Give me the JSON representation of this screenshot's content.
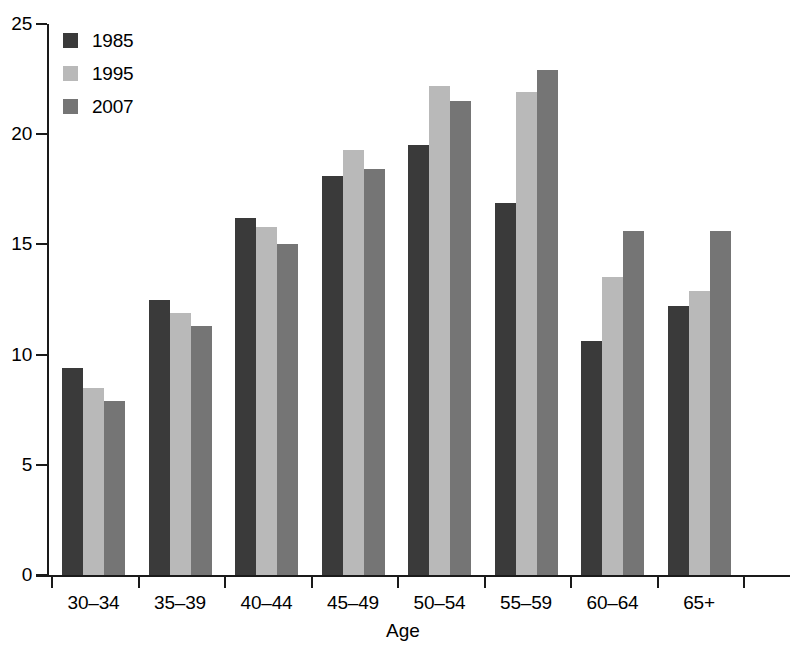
{
  "chart_data": {
    "type": "bar",
    "title": "",
    "subtitle": "",
    "xlabel": "Age",
    "ylabel": "",
    "categories": [
      "30–34",
      "35–39",
      "40–44",
      "45–49",
      "50–54",
      "55–59",
      "60–64",
      "65+"
    ],
    "series": [
      {
        "name": "1985",
        "color": "#3a3a3a",
        "values": [
          9.4,
          12.5,
          16.2,
          18.1,
          19.5,
          16.9,
          10.6,
          12.2
        ]
      },
      {
        "name": "1995",
        "color": "#b9b9b9",
        "values": [
          8.5,
          11.9,
          15.8,
          19.3,
          22.2,
          21.9,
          13.5,
          12.9
        ]
      },
      {
        "name": "2007",
        "color": "#757575",
        "values": [
          7.9,
          11.3,
          15.0,
          18.4,
          21.5,
          22.9,
          15.6,
          15.6
        ]
      }
    ],
    "ylim": [
      0,
      25
    ],
    "yticks": [
      0,
      5,
      10,
      15,
      20,
      25
    ],
    "ytick_labels": [
      "0",
      "5",
      "10",
      "15",
      "20",
      "25"
    ],
    "grid": false,
    "legend_position": "top-left"
  }
}
